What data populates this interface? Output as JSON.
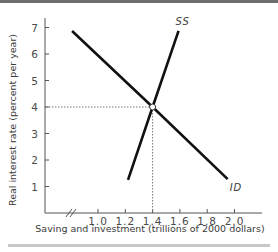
{
  "chart_data": {
    "type": "line",
    "title": "",
    "xlabel": "Saving and investment (trillions of 2000 dollars)",
    "ylabel": "Real interest rate (percent per year)",
    "xlim": [
      0.8,
      2.1
    ],
    "ylim": [
      0,
      7.3
    ],
    "x_ticks": [
      "1.0",
      "1.2",
      "1.4",
      "1.6",
      "1.8",
      "2.0"
    ],
    "y_ticks": [
      "1",
      "2",
      "3",
      "4",
      "5",
      "6",
      "7"
    ],
    "axis_break": true,
    "grid": false,
    "series": [
      {
        "name": "ID",
        "label": "ID",
        "points": [
          [
            0.81,
            6.87
          ],
          [
            1.4,
            4.0
          ],
          [
            1.95,
            1.28
          ]
        ]
      },
      {
        "name": "SS",
        "label": "SS",
        "points": [
          [
            1.22,
            1.25
          ],
          [
            1.4,
            4.0
          ],
          [
            1.59,
            6.87
          ]
        ]
      }
    ],
    "equilibrium": {
      "x": 1.4,
      "y": 4.0,
      "dotted_guides": true
    }
  }
}
